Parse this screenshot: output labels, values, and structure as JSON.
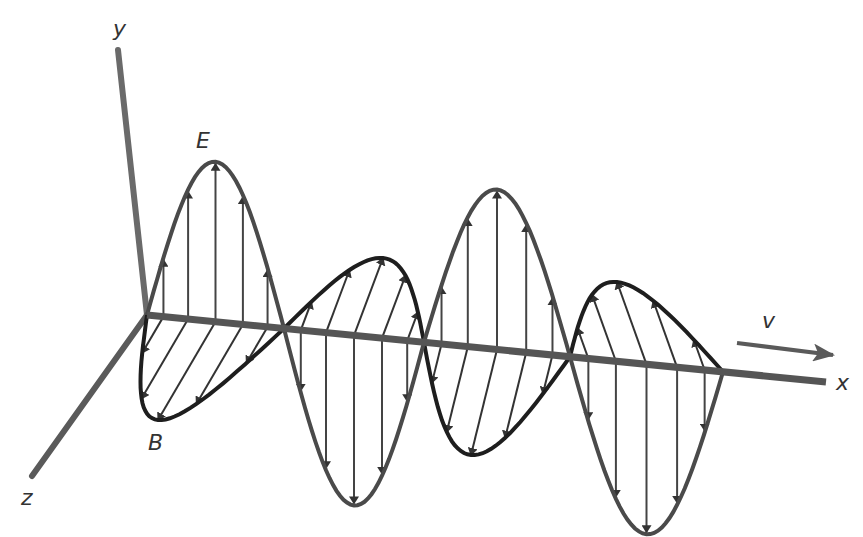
{
  "diagram": {
    "labels": {
      "y_axis": "y",
      "x_axis": "x",
      "z_axis": "z",
      "electric_field": "E",
      "magnetic_field": "B",
      "velocity": "v"
    },
    "colors": {
      "background": "#ffffff",
      "axis": "#5a5a5a",
      "e_wave": "#4a4a4a",
      "b_wave": "#1e1e1e",
      "arrow": "#333333",
      "label": "#333333"
    },
    "geometry": {
      "origin": [
        147,
        315
      ],
      "x_axis_end": [
        826,
        382
      ],
      "y_axis_end": [
        118,
        50
      ],
      "z_axis_end": [
        32,
        476
      ],
      "zero_crossings_x": [
        147,
        284,
        424,
        570,
        723
      ],
      "e_lobes": [
        {
          "from": 147,
          "to": 284,
          "amplitude": -160,
          "direction": "up"
        },
        {
          "from": 284,
          "to": 424,
          "amplitude": 170,
          "direction": "down"
        },
        {
          "from": 424,
          "to": 570,
          "amplitude": -160,
          "direction": "up"
        },
        {
          "from": 570,
          "to": 723,
          "amplitude": 170,
          "direction": "down"
        }
      ],
      "b_lobes": [
        {
          "from": 147,
          "to": 284,
          "direction": "toward-viewer",
          "tip": [
            158,
            420
          ]
        },
        {
          "from": 284,
          "to": 424,
          "direction": "away-from-viewer",
          "tip": [
            383,
            258
          ]
        },
        {
          "from": 424,
          "to": 570,
          "direction": "toward-viewer",
          "tip": [
            471,
            455
          ]
        },
        {
          "from": 570,
          "to": 723,
          "direction": "away-from-viewer",
          "tip": [
            617,
            282
          ]
        }
      ],
      "velocity_arrow": {
        "from": [
          737,
          343
        ],
        "to": [
          833,
          355
        ]
      }
    }
  }
}
